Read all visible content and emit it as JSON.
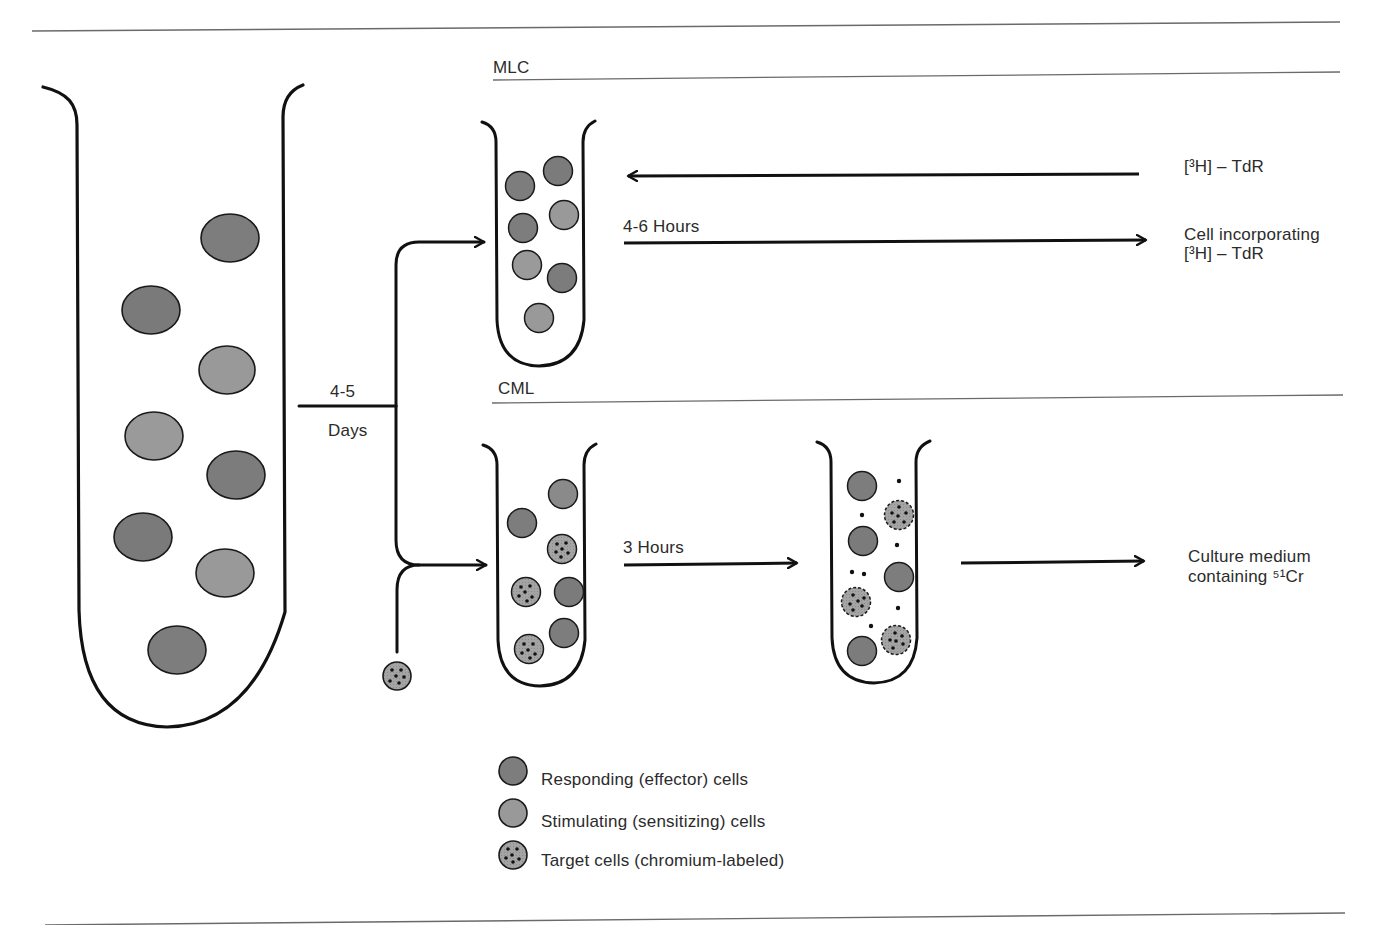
{
  "sections": {
    "mlc": "MLC",
    "cml": "CML"
  },
  "initial_culture": {
    "duration_value": "4-5",
    "duration_unit": "Days"
  },
  "mlc_branch": {
    "input_reagent": "[³H] – TdR",
    "incubation": "4-6 Hours",
    "output_line1": "Cell incorporating",
    "output_line2": "[³H] – TdR"
  },
  "cml_branch": {
    "incubation": "3 Hours",
    "output_line1": "Culture medium",
    "output_line2": "containing ⁵¹Cr"
  },
  "legend": {
    "items": [
      {
        "label": "Responding (effector) cells",
        "type": "responding"
      },
      {
        "label": "Stimulating (sensitizing) cells",
        "type": "stimulating"
      },
      {
        "label": "Target cells (chromium-labeled)",
        "type": "target"
      }
    ]
  },
  "colors": {
    "responding_fill": "#7d7d7d",
    "stimulating_fill": "#9a9a9a",
    "target_fill": "#a8a8a8",
    "outline": "#1a1a1a",
    "rule": "#6a6a6a"
  }
}
